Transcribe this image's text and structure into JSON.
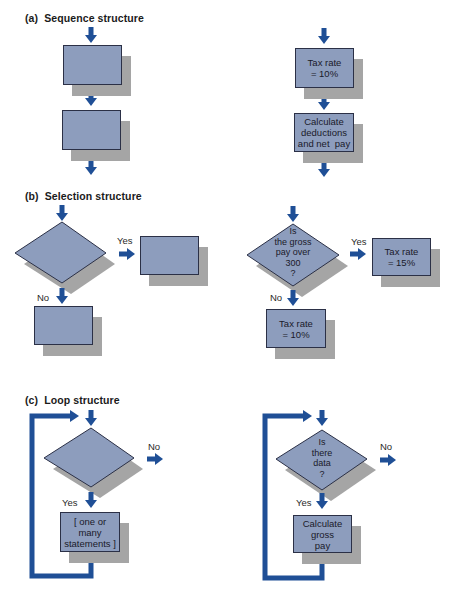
{
  "colors": {
    "shape_fill": "#8d9dbd",
    "shape_border": "#2b3046",
    "shadow": "#a5a5a5",
    "arrow": "#1f4f96"
  },
  "sections": {
    "sequence": {
      "title": "(a)  Sequence structure",
      "example": {
        "step1": "Tax rate\n= 10%",
        "step2": "Calculate\ndeductions\nand net  pay"
      }
    },
    "selection": {
      "title": "(b)  Selection structure",
      "yes_label": "Yes",
      "no_label": "No",
      "example": {
        "condition": "Is\nthe gross\npay over\n300\n?",
        "yes_action": "Tax rate\n= 15%",
        "no_action": "Tax rate\n= 10%"
      }
    },
    "loop": {
      "title": "(c)  Loop structure",
      "yes_label": "Yes",
      "no_label": "No",
      "generic_body": "[ one or\nmany\nstatements ]",
      "example": {
        "condition": "Is\nthere\ndata\n?",
        "body": "Calculate\ngross\npay"
      }
    }
  }
}
